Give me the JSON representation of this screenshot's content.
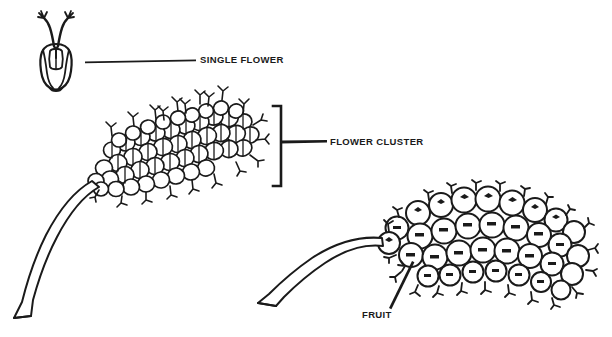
{
  "figure": {
    "title": "Botanical line drawing of a flowering plant showing a single flower, a flower cluster and a fruit cluster",
    "background_color": "#ffffff",
    "ink_color": "#1a1a1a"
  },
  "labels": {
    "single_flower": "SINGLE FLOWER",
    "flower_cluster": "FLOWER CLUSTER",
    "fruit": "FRUIT"
  },
  "parts": {
    "single_flower_icon": "single-flower-drawing",
    "flower_cluster_icon": "flower-cluster-drawing",
    "fruit_cluster_icon": "fruit-cluster-drawing",
    "flower_stem_icon": "flower-stem-drawing",
    "fruit_stem_icon": "fruit-stem-drawing",
    "single_flower_leader": "single-flower-leader-line",
    "flower_cluster_bracket": "flower-cluster-bracket",
    "flower_cluster_leader": "flower-cluster-leader-line",
    "fruit_leader": "fruit-leader-line"
  }
}
